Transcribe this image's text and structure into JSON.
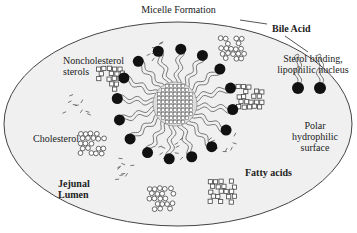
{
  "title": "Micelle Formation",
  "labels": {
    "bile_acid": "Bile Acid",
    "noncholesterol_line1": "Noncholesterol",
    "noncholesterol_line2": "sterols",
    "cholesterol": "Cholesterol",
    "jejunal_line1": "Jejunal",
    "jejunal_line2": "Lumen",
    "sterol_line1": "Sterol binding,",
    "sterol_line2": "lipophilic nucleus",
    "polar_line1": "Polar",
    "polar_line2": "hydrophilic",
    "polar_line3": "surface",
    "fatty_acids": "Fatty acids"
  },
  "colors": {
    "lumen_fill": "#f0f0f0",
    "outline": "#444444",
    "head": "#111111",
    "background": "#ffffff"
  },
  "micelle": {
    "cx": 175,
    "cy": 104,
    "core_r": 22,
    "head_r": 58,
    "head_count": 16
  },
  "clusters": [
    {
      "kind": "circles",
      "name": "cholesterol-cluster-top",
      "x": 218,
      "y": 36
    },
    {
      "kind": "squares",
      "name": "noncholesterol-cluster-left",
      "x": 96,
      "y": 66
    },
    {
      "kind": "squares",
      "name": "noncholesterol-cluster-right",
      "x": 236,
      "y": 84
    },
    {
      "kind": "circles",
      "name": "cholesterol-cluster-left",
      "x": 78,
      "y": 131
    },
    {
      "kind": "circles",
      "name": "cholesterol-cluster-bottom",
      "x": 147,
      "y": 186
    },
    {
      "kind": "squares",
      "name": "noncholesterol-cluster-bottom",
      "x": 208,
      "y": 179
    }
  ]
}
